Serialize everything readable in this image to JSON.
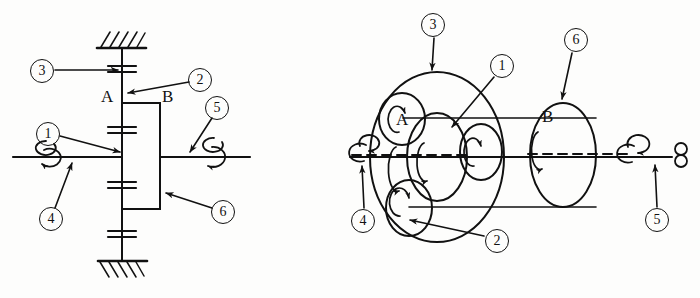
{
  "figure": {
    "subtitle": "Schematic kinematic diagram and pictorial view",
    "background_color": "#fdfdfc",
    "ink_color": "#111111"
  },
  "left_view": {
    "name": "schematic-kinematic-diagram",
    "letter_labels": [
      {
        "text": "A",
        "x": 104,
        "y": 96
      },
      {
        "text": "B",
        "x": 162,
        "y": 96
      }
    ],
    "callouts": [
      {
        "id": "3",
        "text": "3",
        "cx": 41,
        "cy": 70,
        "meaning": "fixed-annulus-ring-gear"
      },
      {
        "id": "2",
        "text": "2",
        "cx": 199,
        "cy": 79,
        "meaning": "planet-gear"
      },
      {
        "id": "5",
        "text": "5",
        "cx": 216,
        "cy": 107,
        "meaning": "output-shaft"
      },
      {
        "id": "1",
        "text": "1",
        "cx": 47,
        "cy": 133,
        "meaning": "sun-gear"
      },
      {
        "id": "4",
        "text": "4",
        "cx": 50,
        "cy": 218,
        "meaning": "input-shaft"
      },
      {
        "id": "6",
        "text": "6",
        "cx": 222,
        "cy": 211,
        "meaning": "planet-carrier-arm"
      }
    ]
  },
  "right_view": {
    "name": "pictorial-perspective-view",
    "letter_labels": [
      {
        "text": "A",
        "x": 401,
        "y": 119
      },
      {
        "text": "B",
        "x": 547,
        "y": 117
      }
    ],
    "callouts": [
      {
        "id": "3",
        "text": "3",
        "cx": 432,
        "cy": 24,
        "meaning": "fixed-annulus-ring-gear"
      },
      {
        "id": "6",
        "text": "6",
        "cx": 575,
        "cy": 39,
        "meaning": "planet-carrier-arm"
      },
      {
        "id": "1",
        "text": "1",
        "cx": 501,
        "cy": 65,
        "meaning": "sun-gear"
      },
      {
        "id": "2",
        "text": "2",
        "cx": 496,
        "cy": 240,
        "meaning": "planet-gear"
      },
      {
        "id": "4",
        "text": "4",
        "cx": 362,
        "cy": 220,
        "meaning": "input-shaft"
      },
      {
        "id": "5",
        "text": "5",
        "cx": 656,
        "cy": 219,
        "meaning": "output-shaft"
      }
    ]
  },
  "legend_keys": [
    {
      "id": "1",
      "label": "Sun gear"
    },
    {
      "id": "2",
      "label": "Planet gear"
    },
    {
      "id": "3",
      "label": "Annulus / ring gear (fixed)"
    },
    {
      "id": "4",
      "label": "Input shaft"
    },
    {
      "id": "5",
      "label": "Output shaft"
    },
    {
      "id": "6",
      "label": "Planet carrier"
    }
  ]
}
